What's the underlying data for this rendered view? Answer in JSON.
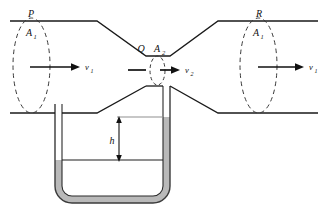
{
  "figure": {
    "type": "physics-diagram",
    "width": 327,
    "height": 208,
    "background_color": "#ffffff",
    "line_color": "#111111",
    "fluid_color": "#b9b9b9",
    "tube_wall_color": "#333333",
    "dashed_color": "#3a3a3a"
  },
  "labels": {
    "point_p": "P",
    "point_q": "Q",
    "point_r": "R",
    "area_left": "A",
    "area_left_sub": "1",
    "area_throat": "A",
    "area_throat_sub": "2",
    "area_right": "A",
    "area_right_sub": "1",
    "velocity_left": "v",
    "velocity_left_sub": "1",
    "velocity_throat": "v",
    "velocity_throat_sub": "2",
    "velocity_right": "v",
    "velocity_right_sub": "1",
    "height_difference": "h"
  },
  "geometry": {
    "pipe_top_y": 21,
    "pipe_bottom_y": 113,
    "throat_top_y": 56,
    "throat_bottom_y": 86,
    "wide_left_end_x": 10,
    "wide_right_end_x": 318,
    "taper_in_start_x": 97,
    "throat_left_x": 146,
    "throat_right_x": 170,
    "taper_out_end_x": 218,
    "manometer_left_tube_x": 62,
    "manometer_right_tube_x": 163,
    "manometer_bottom_y": 196,
    "mercury_left_level_y": 160,
    "mercury_right_level_y": 117,
    "h_top_y": 118,
    "h_bottom_y": 160
  },
  "annotations": {
    "description": "Fluid flows left to right through a horizontal Venturi tube. Cross-sectional area A1 at wide sections P and R, reduced area A2 at throat Q. Velocity v1 in wide sections, v2 at throat. A U-tube manometer connects the wide section to the throat and shows a mercury height difference h."
  }
}
